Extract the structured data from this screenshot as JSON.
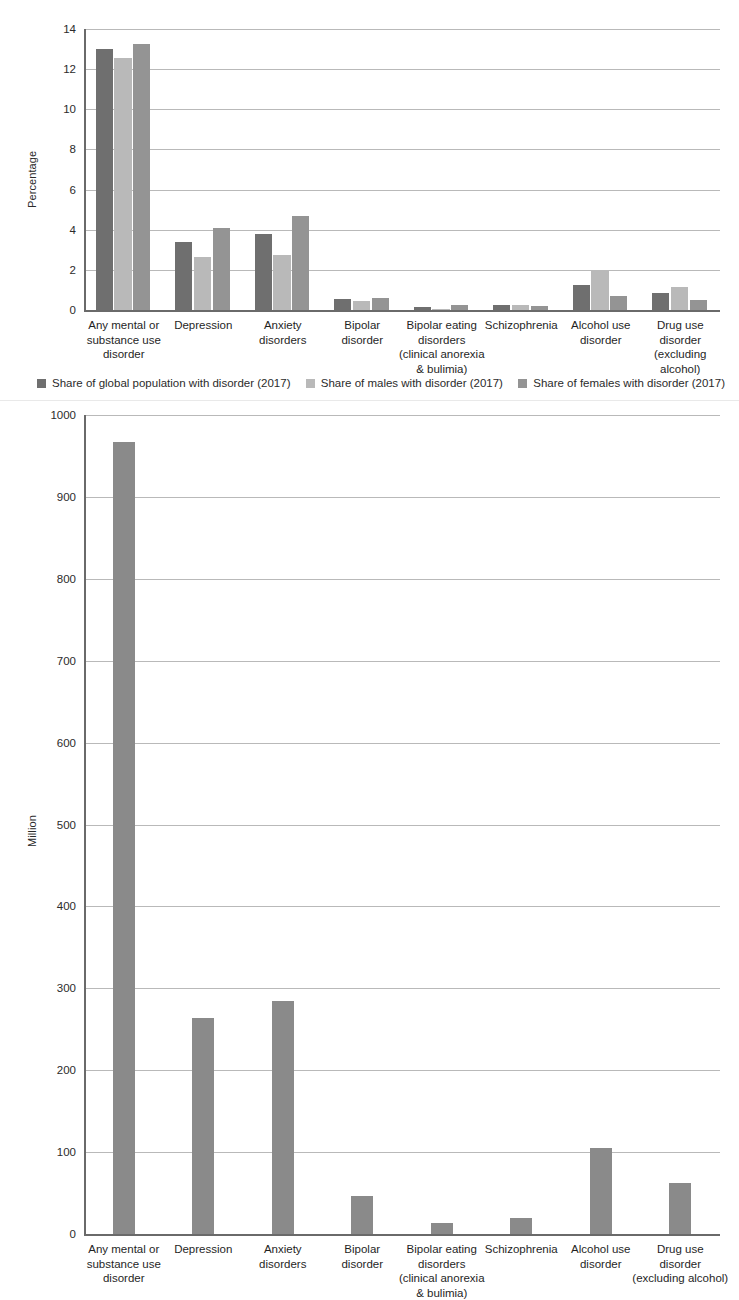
{
  "chart_data": [
    {
      "id": "chart1",
      "type": "bar",
      "title": "",
      "xlabel": "",
      "ylabel": "Percentage",
      "ylim": [
        0,
        14
      ],
      "ytick_step": 2,
      "yticks": [
        "0",
        "2",
        "4",
        "6",
        "8",
        "10",
        "12",
        "14"
      ],
      "grid": true,
      "legend_position": "bottom",
      "categories": [
        "Any mental or\nsubstance use\ndisorder",
        "Depression",
        "Anxiety\ndisorders",
        "Bipolar\ndisorder",
        "Bipolar eating\ndisorders\n(clinical anorexia\n& bulimia)",
        "Schizophrenia",
        "Alcohol use\ndisorder",
        "Drug use\ndisorder\n(excluding\nalcohol)"
      ],
      "series": [
        {
          "name": "Share of global population with disorder (2017)",
          "color": "#6f6f6f",
          "values": [
            12.98,
            3.38,
            3.78,
            0.54,
            0.13,
            0.26,
            1.26,
            0.85
          ]
        },
        {
          "name": "Share of males with disorder (2017)",
          "color": "#b9b9b9",
          "values": [
            12.55,
            2.63,
            2.72,
            0.46,
            0.04,
            0.25,
            1.92,
            1.16
          ]
        },
        {
          "name": "Share of females with disorder (2017)",
          "color": "#949494",
          "values": [
            13.24,
            4.08,
            4.66,
            0.6,
            0.23,
            0.22,
            0.7,
            0.5
          ]
        }
      ]
    },
    {
      "id": "chart2",
      "type": "bar",
      "title": "",
      "xlabel": "",
      "ylabel": "Million",
      "ylim": [
        0,
        1000
      ],
      "ytick_step": 100,
      "yticks": [
        "0",
        "100",
        "200",
        "300",
        "400",
        "500",
        "600",
        "700",
        "800",
        "900",
        "1000"
      ],
      "grid": true,
      "legend_position": "none",
      "categories": [
        "Any mental or\nsubstance use\ndisorder",
        "Depression",
        "Anxiety\ndisorders",
        "Bipolar\ndisorder",
        "Bipolar eating\ndisorders\n(clinical anorexia\n& bulimia)",
        "Schizophrenia",
        "Alcohol use\ndisorder",
        "Drug use\ndisorder\n(excluding alcohol)"
      ],
      "series": [
        {
          "name": "Number of people with disorder (2017)",
          "color": "#8a8a8a",
          "values": [
            967,
            264,
            284,
            46,
            14,
            20,
            105,
            62
          ]
        }
      ]
    }
  ]
}
